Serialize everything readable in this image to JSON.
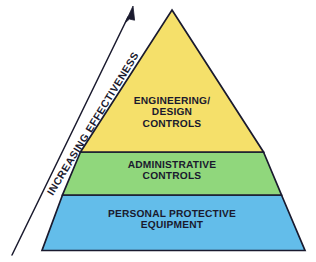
{
  "diagram": {
    "type": "pyramid",
    "name": "Hierarchy of Controls Pyramid",
    "background_color": "#ffffff",
    "outline_color": "#1a1a2e",
    "text_color": "#1a1a2e",
    "axis_caption": "INCREASING EFFECTIVENESS",
    "axis_direction": "upward",
    "arrow_icon": "up-right-arrow-icon",
    "tiers": [
      {
        "id": "engineering",
        "rank": 1,
        "position": "top",
        "label": "ENGINEERING/\nDESIGN\nCONTROLS",
        "lines": [
          "ENGINEERING/",
          "DESIGN",
          "CONTROLS"
        ],
        "color": "#f5e06a",
        "effectiveness": "highest"
      },
      {
        "id": "administrative",
        "rank": 2,
        "position": "middle",
        "label": "ADMINISTRATIVE\nCONTROLS",
        "lines": [
          "ADMINISTRATIVE",
          "CONTROLS"
        ],
        "color": "#90d77c",
        "effectiveness": "medium"
      },
      {
        "id": "ppe",
        "rank": 3,
        "position": "bottom",
        "label": "PERSONAL PROTECTIVE\nEQUIPMENT",
        "lines": [
          "PERSONAL PROTECTIVE",
          "EQUIPMENT"
        ],
        "color": "#63bdea",
        "effectiveness": "lowest"
      }
    ]
  }
}
